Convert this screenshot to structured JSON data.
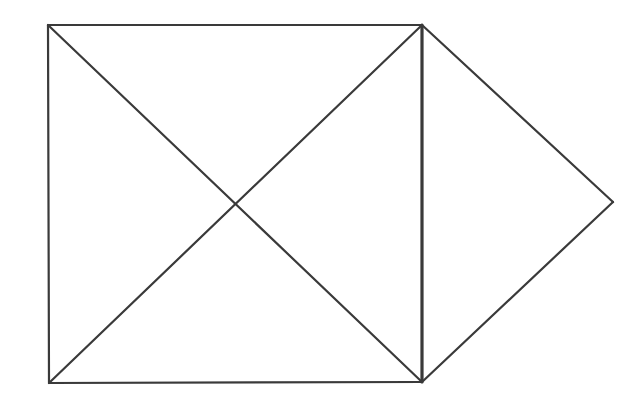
{
  "diagram": {
    "background": "#ffffff",
    "stroke_color": "#3a3a3a",
    "vertices": {
      "A": [
        48,
        25
      ],
      "B": [
        422,
        25
      ],
      "C": [
        422,
        382
      ],
      "D": [
        49,
        383
      ],
      "E": [
        613,
        202
      ]
    },
    "edges": [
      {
        "name": "square-top-edge",
        "from": "A",
        "to": "B",
        "width": 2.2
      },
      {
        "name": "square-left-edge",
        "from": "A",
        "to": "D",
        "width": 2.2
      },
      {
        "name": "square-bottom-edge",
        "from": "D",
        "to": "C",
        "width": 2.2
      },
      {
        "name": "square-right-edge",
        "from": "B",
        "to": "C",
        "width": 3.2
      },
      {
        "name": "diagonal-top-left-to-bottom-right",
        "from": "A",
        "to": "C",
        "width": 2.2
      },
      {
        "name": "diagonal-bottom-left-to-top-right",
        "from": "D",
        "to": "B",
        "width": 2.2
      },
      {
        "name": "triangle-upper-edge",
        "from": "B",
        "to": "E",
        "width": 2.2
      },
      {
        "name": "triangle-lower-edge",
        "from": "C",
        "to": "E",
        "width": 2.2
      }
    ]
  }
}
